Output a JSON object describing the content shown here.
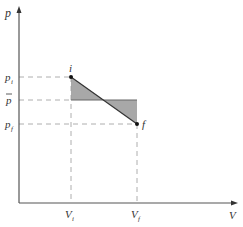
{
  "diagram": {
    "axes": {
      "y_label": "p",
      "x_label": "V",
      "origin": [
        19,
        203
      ],
      "y_top": 8,
      "x_right": 236,
      "color": "#555555"
    },
    "points": {
      "i": {
        "label": "i",
        "x": 71,
        "y": 77
      },
      "f": {
        "label": "f",
        "x": 137,
        "y": 124
      }
    },
    "levels": {
      "p_i": {
        "label": "p",
        "sub": "i",
        "y": 77
      },
      "p_bar": {
        "label": "p",
        "bar": true,
        "y": 100
      },
      "p_f": {
        "label": "p",
        "sub": "f",
        "y": 124
      }
    },
    "volumes": {
      "V_i": {
        "label": "V",
        "sub": "i",
        "x": 71
      },
      "V_f": {
        "label": "V",
        "sub": "f",
        "x": 137
      }
    },
    "shade_color": "#a8a8a8",
    "dash_color": "#999999"
  }
}
